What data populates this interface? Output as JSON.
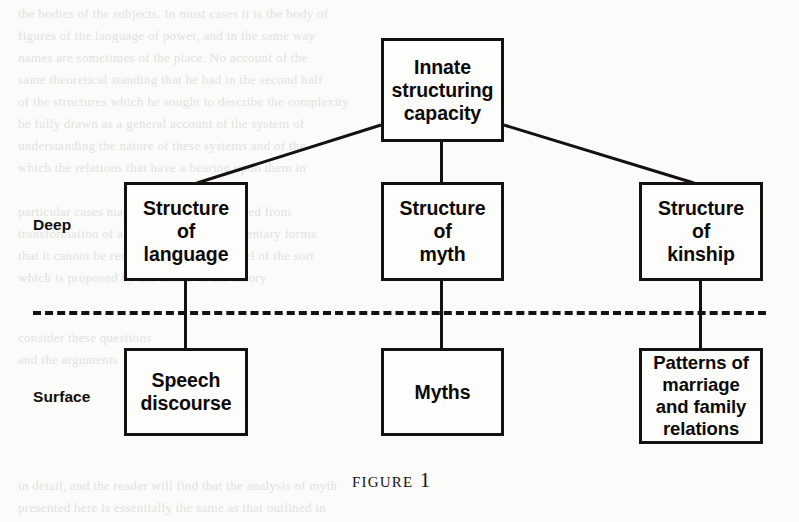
{
  "figure": {
    "caption": "Figure 1",
    "background_color": "#fbfbfa",
    "ink_color": "#15110f",
    "layers": {
      "deep_label": "Deep",
      "surface_label": "Surface",
      "divider_style": "dashed"
    },
    "nodes": {
      "root": {
        "label": "Innate\nstructuring\ncapacity"
      },
      "deep_language": {
        "label": "Structure\nof\nlanguage"
      },
      "deep_myth": {
        "label": "Structure\nof\nmyth"
      },
      "deep_kinship": {
        "label": "Structure\nof\nkinship"
      },
      "surface_speech": {
        "label": "Speech\ndiscourse"
      },
      "surface_myths": {
        "label": "Myths"
      },
      "surface_patterns": {
        "label": "Patterns of\nmarriage\nand  family\nrelations"
      }
    }
  },
  "page_bleed": {
    "line_1": "the  bodies  of  the  subjects.  In  most  cases  it  is  the  body  of",
    "line_2": "figures  of  the  language  of  power,  and  in  the  same  way",
    "line_3": "names  are  sometimes  of  the  place.  No  account  of  the",
    "line_4": "same  theoretical  standing  that  he  had  in  the  second  half",
    "line_5": "of  the  structures  which  he  sought  to  describe  the  complexity",
    "line_6": "be  fully  drawn  as  a  general  account  of  the  system  of",
    "line_7": "understanding  the  nature  of  these  systems  and  of  the",
    "line_8": "which  the  relations  that  have  a  bearing  upon  them  in",
    "line_9": "particular  cases  may  then  be  seen  as  derived  from",
    "line_10": "transformation  of  a  small  number  of  elementary  forms",
    "line_11": "that  it  cannot  be  reduced  to  a  simple  model  of  the  sort",
    "line_12": "which  is  proposed  by  the  critics  of  the  theory",
    "line_13": "consider  these  questions",
    "line_14": "and  the  arguments",
    "line_15": "in  detail,  and  the  reader  will  find  that  the  analysis  of  myth",
    "line_16": "presented  here  is  essentially  the  same  as  that  outlined  in"
  }
}
